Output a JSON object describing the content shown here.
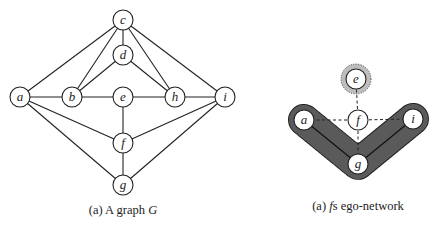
{
  "left_panel": {
    "caption_prefix": "(a) A graph ",
    "caption_var": "G",
    "nodes": [
      {
        "id": "a",
        "label": "a",
        "x": 20,
        "y": 97
      },
      {
        "id": "b",
        "label": "b",
        "x": 72,
        "y": 97
      },
      {
        "id": "c",
        "label": "c",
        "x": 123,
        "y": 20
      },
      {
        "id": "d",
        "label": "d",
        "x": 123,
        "y": 55
      },
      {
        "id": "e",
        "label": "e",
        "x": 123,
        "y": 97
      },
      {
        "id": "f",
        "label": "f",
        "x": 123,
        "y": 143
      },
      {
        "id": "g",
        "label": "g",
        "x": 123,
        "y": 185
      },
      {
        "id": "h",
        "label": "h",
        "x": 175,
        "y": 97
      },
      {
        "id": "i",
        "label": "i",
        "x": 225,
        "y": 97
      }
    ],
    "edges": [
      [
        "a",
        "c"
      ],
      [
        "a",
        "b"
      ],
      [
        "a",
        "f"
      ],
      [
        "a",
        "g"
      ],
      [
        "b",
        "c"
      ],
      [
        "b",
        "d"
      ],
      [
        "b",
        "e"
      ],
      [
        "c",
        "d"
      ],
      [
        "c",
        "h"
      ],
      [
        "c",
        "i"
      ],
      [
        "d",
        "h"
      ],
      [
        "e",
        "h"
      ],
      [
        "e",
        "f"
      ],
      [
        "h",
        "i"
      ],
      [
        "f",
        "i"
      ],
      [
        "f",
        "g"
      ],
      [
        "g",
        "i"
      ]
    ]
  },
  "right_panel": {
    "caption_prefix": "(a) ",
    "caption_var": "f",
    "caption_suffix": "s ego-network",
    "ego": "f",
    "nodes": [
      {
        "id": "e",
        "label": "e",
        "x": 356,
        "y": 79,
        "highlight": "light-gray"
      },
      {
        "id": "f",
        "label": "f",
        "x": 358,
        "y": 120
      },
      {
        "id": "a",
        "label": "a",
        "x": 304,
        "y": 120
      },
      {
        "id": "i",
        "label": "i",
        "x": 413,
        "y": 119
      },
      {
        "id": "g",
        "label": "g",
        "x": 358,
        "y": 164
      }
    ],
    "dashed_edges": [
      [
        "f",
        "e"
      ],
      [
        "f",
        "a"
      ],
      [
        "f",
        "i"
      ],
      [
        "f",
        "g"
      ]
    ],
    "solid_edges": [
      [
        "a",
        "g"
      ],
      [
        "g",
        "i"
      ]
    ],
    "component_colors": {
      "dark_group": "#5a5a5a",
      "light_group": "#bdbdbd"
    }
  }
}
